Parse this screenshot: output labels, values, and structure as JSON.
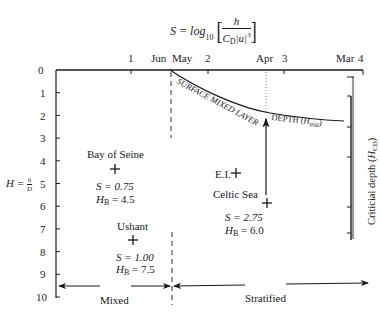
{
  "title": {
    "formula_lhs": "S = log",
    "formula_base": "10",
    "numerator": "h",
    "denominator_c": "C",
    "denominator_sub": "D",
    "denominator_u": "|u|",
    "denominator_exp": "3"
  },
  "top_axis": {
    "ticks": [
      {
        "label": "1",
        "x": 131
      },
      {
        "label": "2",
        "x": 208
      },
      {
        "label": "3",
        "x": 284
      },
      {
        "label": "4",
        "x": 361
      }
    ],
    "months": [
      {
        "label": "Jun",
        "x": 151
      },
      {
        "label": "May",
        "x": 175
      },
      {
        "label": "Apr",
        "x": 265
      },
      {
        "label": "Mar",
        "x": 338
      }
    ]
  },
  "y_axis": {
    "label_lhs": "H = ",
    "label_num": "h",
    "label_den": "D",
    "ticks": [
      "0",
      "1",
      "2",
      "3",
      "4",
      "5",
      "6",
      "7",
      "8",
      "9",
      "10"
    ]
  },
  "curve_label": {
    "main": "SURFACE MIXED LAYER",
    "depth": "DEPTH (",
    "depth_sym": "H",
    "depth_sub": "mld",
    "depth_close": ")"
  },
  "critical_depth": {
    "label": "Criticial depth (",
    "sym": "H",
    "sub": "CD",
    "close": ")"
  },
  "sites": [
    {
      "name": "Bay of Seine",
      "S": "S = 0.75",
      "HB_sym": "H",
      "HB_sub": "B",
      "HB_val": " = 4.5"
    },
    {
      "name": "Ushant",
      "S": "S = 1.00",
      "HB_sym": "H",
      "HB_sub": "B",
      "HB_val": " = 7.5"
    },
    {
      "name": "Celtic Sea",
      "S": "S = 2.75",
      "HB_sym": "H",
      "HB_sub": "B",
      "HB_val": " = 6.0"
    },
    {
      "name": "E.I."
    }
  ],
  "regions": {
    "mixed": "Mixed",
    "stratified": "Stratified"
  },
  "colors": {
    "ink": "#1a1a1a",
    "grey_bar": "#9a9a9a"
  }
}
